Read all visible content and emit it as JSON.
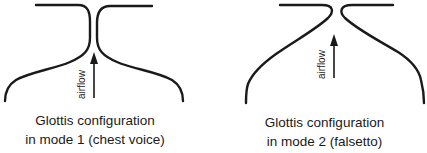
{
  "figure": {
    "panels": [
      {
        "id": "mode1",
        "arrow_label": "airflow",
        "caption_line1": "Glottis configuration",
        "caption_line2": "in mode 1 (chest voice)"
      },
      {
        "id": "mode2",
        "arrow_label": "airflow",
        "caption_line1": "Glottis configuration",
        "caption_line2": "in mode 2 (falsetto)"
      }
    ],
    "colors": {
      "ink": "#1a1a1a",
      "background": "#ffffff"
    }
  }
}
